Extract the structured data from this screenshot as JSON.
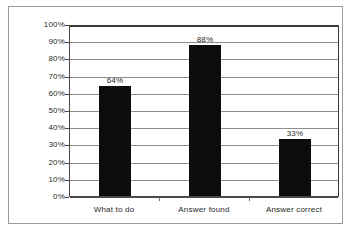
{
  "chart_data": {
    "type": "bar",
    "title": "",
    "subtitle": "",
    "xlabel": "",
    "ylabel": "",
    "categories": [
      "What to do",
      "Answer found",
      "Answer correct"
    ],
    "values": [
      64,
      88,
      33
    ],
    "data_labels": [
      "64%",
      "88%",
      "33%"
    ],
    "ylim": [
      0,
      100
    ],
    "ytick_values": [
      0,
      10,
      20,
      30,
      40,
      50,
      60,
      70,
      80,
      90,
      100
    ],
    "ytick_labels": [
      "0%",
      "10%",
      "20%",
      "30%",
      "40%",
      "50%",
      "60%",
      "70%",
      "80%",
      "90%",
      "100%"
    ],
    "grid": true,
    "grid_axis": "y",
    "legend": false,
    "legend_position": "none",
    "series": [
      {
        "name": "",
        "values": [
          64,
          88,
          33
        ],
        "color": "#0d0d0d"
      }
    ],
    "colors": {
      "bar": "#0d0d0d",
      "gridline": "#8c8c8c",
      "axis": "#4a4a4a",
      "plot_border": "#3a3a3a",
      "frame": "#9a9a9a",
      "background": "#ffffff",
      "text": "#1f1f1f"
    }
  }
}
